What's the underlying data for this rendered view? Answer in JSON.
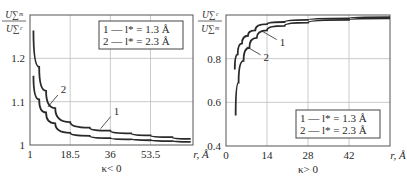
{
  "chart_data": [
    {
      "type": "line",
      "panel": "left",
      "ylabel_num": "U∑ᵐ",
      "ylabel_den": "U∑ᶜ",
      "xlabel": "r, Å",
      "subtitle": "κ< 0",
      "xticks": [
        "1",
        "18.5",
        "36",
        "53.5"
      ],
      "xtick_values": [
        1,
        18.5,
        36,
        53.5
      ],
      "yticks": [
        "1",
        "1.1",
        "1.2"
      ],
      "ytick_values": [
        1.0,
        1.1,
        1.2
      ],
      "xlim": [
        1,
        72
      ],
      "ylim": [
        1.0,
        1.3
      ],
      "grid": true,
      "legend_position": "upper right",
      "legend": [
        "1 — l* = 1.3 Å",
        "2 — l* = 2.3 Å"
      ],
      "series": [
        {
          "name": "1",
          "x": [
            2.5,
            5,
            8,
            12,
            18.5,
            27,
            36,
            45,
            53.5,
            63,
            71
          ],
          "y": [
            1.16,
            1.105,
            1.075,
            1.05,
            1.028,
            1.021,
            1.016,
            1.013,
            1.011,
            1.009,
            1.007
          ]
        },
        {
          "name": "2",
          "x": [
            2.5,
            5,
            8,
            12,
            18.5,
            27,
            36,
            45,
            53.5,
            63,
            71
          ],
          "y": [
            1.264,
            1.18,
            1.125,
            1.085,
            1.053,
            1.04,
            1.033,
            1.027,
            1.022,
            1.018,
            1.014
          ]
        }
      ],
      "annotations": [
        {
          "label": "1",
          "x": 37,
          "y": 1.07
        },
        {
          "label": "2",
          "x": 14,
          "y": 1.12
        }
      ]
    },
    {
      "type": "line",
      "panel": "right",
      "ylabel_num": "U∑ᶜ",
      "ylabel_den": "U∑ᵐ",
      "xlabel": "r, Å",
      "subtitle": "κ> 0",
      "xticks": [
        "0",
        "14",
        "28",
        "42"
      ],
      "xtick_values": [
        0,
        14,
        28,
        42
      ],
      "yticks": [
        "0.4",
        "0.6",
        "0.8"
      ],
      "ytick_values": [
        0.4,
        0.6,
        0.8
      ],
      "xlim": [
        0,
        56
      ],
      "ylim": [
        0.4,
        1.0
      ],
      "grid": true,
      "legend_position": "lower right",
      "legend": [
        "1 — l* = 1.3 Å",
        "2 — l* = 2.3 Å"
      ],
      "series": [
        {
          "name": "1",
          "x": [
            3,
            4,
            5.5,
            7.5,
            10,
            14,
            20,
            28,
            42,
            56
          ],
          "y": [
            0.75,
            0.82,
            0.87,
            0.905,
            0.93,
            0.958,
            0.968,
            0.978,
            0.985,
            0.99
          ]
        },
        {
          "name": "2",
          "x": [
            3.3,
            4.3,
            6,
            8,
            10.5,
            14,
            20,
            28,
            42,
            56
          ],
          "y": [
            0.54,
            0.69,
            0.79,
            0.85,
            0.895,
            0.93,
            0.95,
            0.965,
            0.978,
            0.985
          ]
        }
      ],
      "annotations": [
        {
          "label": "1",
          "x": 18,
          "y": 0.86
        },
        {
          "label": "2",
          "x": 12.5,
          "y": 0.79
        }
      ]
    }
  ]
}
